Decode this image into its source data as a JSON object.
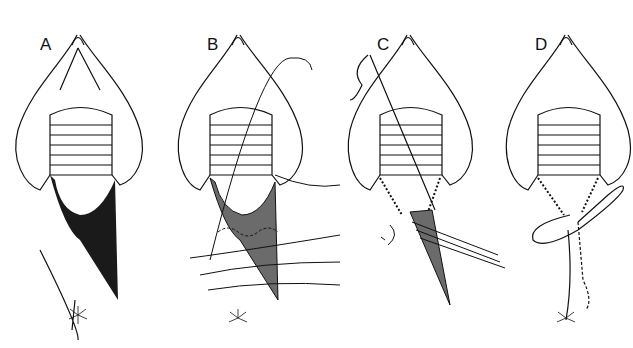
{
  "figure": {
    "background": "#ffffff",
    "ink_color": "#111111",
    "fill_dark": "#1a1a1a",
    "fill_gray": "#6b6b6b",
    "panels": [
      {
        "label": "A",
        "x": 0,
        "label_x": 40,
        "label_y": 36,
        "state": "laceration-dark"
      },
      {
        "label": "B",
        "x": 170,
        "label_x": 207,
        "label_y": 36,
        "state": "suture-placement"
      },
      {
        "label": "C",
        "x": 340,
        "label_x": 377,
        "label_y": 36,
        "state": "sutures-tied-lateral"
      },
      {
        "label": "D",
        "x": 498,
        "label_x": 535,
        "label_y": 36,
        "state": "final-closure"
      }
    ]
  }
}
